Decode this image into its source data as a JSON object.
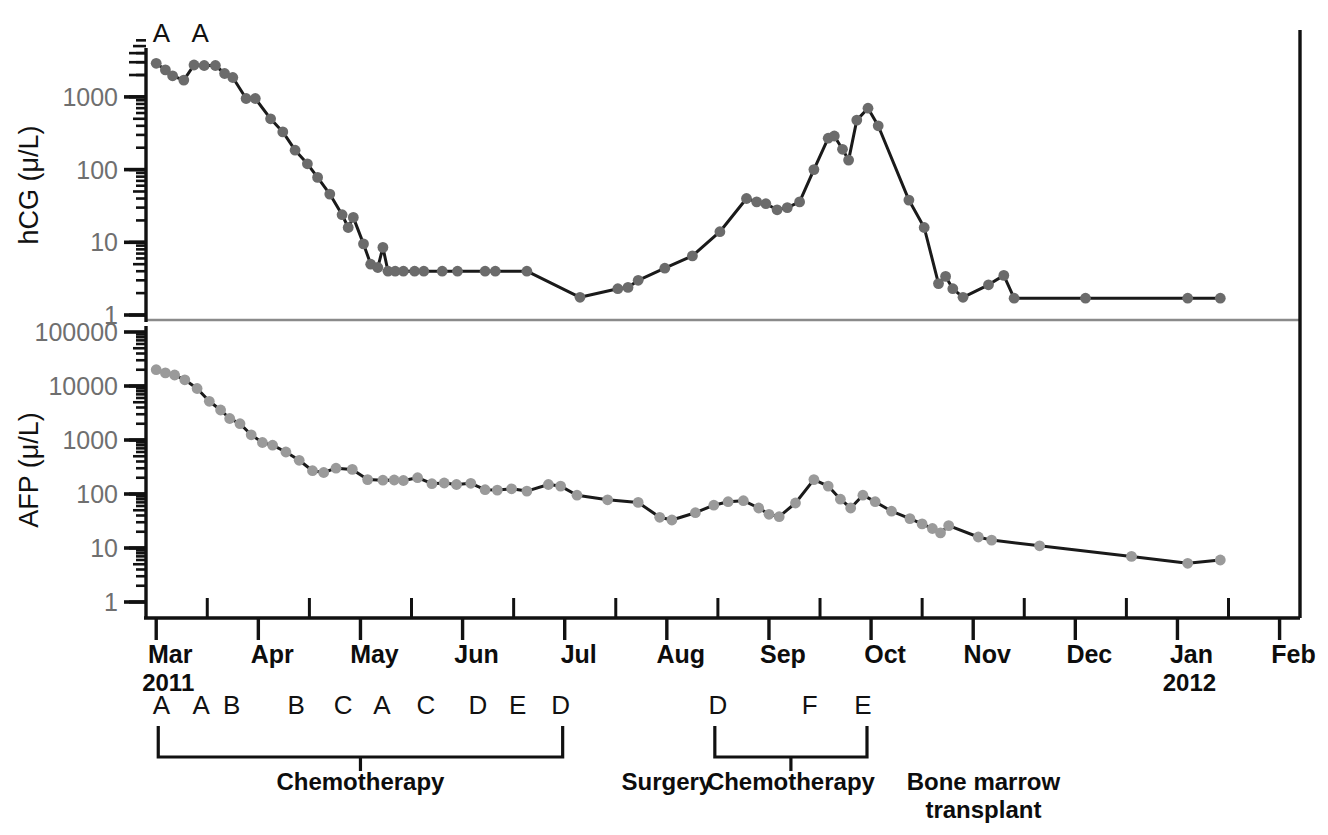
{
  "chart_data": {
    "type": "line",
    "title": "",
    "subtitle": "",
    "panels": [
      {
        "id": "hcg",
        "ylabel": "hCG (μ/L)",
        "yticks": [
          1000,
          100,
          10,
          1
        ],
        "yticklabels": [
          "1000",
          "100",
          "10",
          "1"
        ],
        "ylim": [
          1,
          5000
        ],
        "yscale": "log",
        "series_name": "hCG",
        "series_color": "#6b6b6b",
        "line_color": "#1a1a1a",
        "annotations": [
          {
            "label": "A",
            "x_month": 3.05
          },
          {
            "label": "A",
            "x_month": 3.43
          }
        ],
        "points": [
          {
            "t": 3.0,
            "v": 2900
          },
          {
            "t": 3.09,
            "v": 2350
          },
          {
            "t": 3.16,
            "v": 1950
          },
          {
            "t": 3.27,
            "v": 1700
          },
          {
            "t": 3.37,
            "v": 2750
          },
          {
            "t": 3.47,
            "v": 2700
          },
          {
            "t": 3.58,
            "v": 2700
          },
          {
            "t": 3.67,
            "v": 2100
          },
          {
            "t": 3.75,
            "v": 1850
          },
          {
            "t": 3.88,
            "v": 950
          },
          {
            "t": 3.97,
            "v": 950
          },
          {
            "t": 4.12,
            "v": 500
          },
          {
            "t": 4.24,
            "v": 330
          },
          {
            "t": 4.36,
            "v": 185
          },
          {
            "t": 4.48,
            "v": 120
          },
          {
            "t": 4.58,
            "v": 78
          },
          {
            "t": 4.7,
            "v": 46
          },
          {
            "t": 4.82,
            "v": 24
          },
          {
            "t": 4.88,
            "v": 16
          },
          {
            "t": 4.93,
            "v": 22
          },
          {
            "t": 5.03,
            "v": 9.5
          },
          {
            "t": 5.1,
            "v": 5.0
          },
          {
            "t": 5.17,
            "v": 4.5
          },
          {
            "t": 5.22,
            "v": 8.5
          },
          {
            "t": 5.27,
            "v": 4.0
          },
          {
            "t": 5.34,
            "v": 4.0
          },
          {
            "t": 5.42,
            "v": 4.0
          },
          {
            "t": 5.53,
            "v": 4.0
          },
          {
            "t": 5.62,
            "v": 4.0
          },
          {
            "t": 5.8,
            "v": 4.0
          },
          {
            "t": 5.95,
            "v": 4.0
          },
          {
            "t": 6.22,
            "v": 4.0
          },
          {
            "t": 6.32,
            "v": 4.0
          },
          {
            "t": 6.63,
            "v": 4.0
          },
          {
            "t": 7.15,
            "v": 1.75
          },
          {
            "t": 7.52,
            "v": 2.3
          },
          {
            "t": 7.62,
            "v": 2.4
          },
          {
            "t": 7.72,
            "v": 3.0
          },
          {
            "t": 7.98,
            "v": 4.4
          },
          {
            "t": 8.25,
            "v": 6.5
          },
          {
            "t": 8.52,
            "v": 14
          },
          {
            "t": 8.78,
            "v": 40
          },
          {
            "t": 8.88,
            "v": 36
          },
          {
            "t": 8.97,
            "v": 34
          },
          {
            "t": 9.08,
            "v": 28
          },
          {
            "t": 9.18,
            "v": 30
          },
          {
            "t": 9.3,
            "v": 36
          },
          {
            "t": 9.44,
            "v": 100
          },
          {
            "t": 9.58,
            "v": 270
          },
          {
            "t": 9.64,
            "v": 290
          },
          {
            "t": 9.72,
            "v": 190
          },
          {
            "t": 9.78,
            "v": 135
          },
          {
            "t": 9.86,
            "v": 480
          },
          {
            "t": 9.97,
            "v": 700
          },
          {
            "t": 10.07,
            "v": 400
          },
          {
            "t": 10.37,
            "v": 38
          },
          {
            "t": 10.52,
            "v": 16
          },
          {
            "t": 10.66,
            "v": 2.7
          },
          {
            "t": 10.73,
            "v": 3.4
          },
          {
            "t": 10.8,
            "v": 2.3
          },
          {
            "t": 10.9,
            "v": 1.75
          },
          {
            "t": 11.15,
            "v": 2.6
          },
          {
            "t": 11.3,
            "v": 3.5
          },
          {
            "t": 11.4,
            "v": 1.7
          },
          {
            "t": 12.1,
            "v": 1.7
          },
          {
            "t": 13.1,
            "v": 1.7
          },
          {
            "t": 13.42,
            "v": 1.7
          }
        ]
      },
      {
        "id": "afp",
        "ylabel": "AFP (μ/L)",
        "yticks": [
          100000,
          10000,
          1000,
          100,
          10,
          1
        ],
        "yticklabels": [
          "100000",
          "10000",
          "1000",
          "100",
          "10",
          "1"
        ],
        "ylim": [
          1,
          100000
        ],
        "yscale": "log",
        "series_name": "AFP",
        "series_color": "#9a9a9a",
        "line_color": "#1a1a1a",
        "annotations": [],
        "points": [
          {
            "t": 3.0,
            "v": 20000
          },
          {
            "t": 3.09,
            "v": 17500
          },
          {
            "t": 3.18,
            "v": 16000
          },
          {
            "t": 3.28,
            "v": 13000
          },
          {
            "t": 3.4,
            "v": 9000
          },
          {
            "t": 3.52,
            "v": 5200
          },
          {
            "t": 3.63,
            "v": 3600
          },
          {
            "t": 3.72,
            "v": 2500
          },
          {
            "t": 3.82,
            "v": 2000
          },
          {
            "t": 3.93,
            "v": 1250
          },
          {
            "t": 4.04,
            "v": 900
          },
          {
            "t": 4.14,
            "v": 800
          },
          {
            "t": 4.27,
            "v": 600
          },
          {
            "t": 4.4,
            "v": 420
          },
          {
            "t": 4.53,
            "v": 270
          },
          {
            "t": 4.64,
            "v": 250
          },
          {
            "t": 4.76,
            "v": 300
          },
          {
            "t": 4.92,
            "v": 285
          },
          {
            "t": 5.07,
            "v": 185
          },
          {
            "t": 5.22,
            "v": 180
          },
          {
            "t": 5.33,
            "v": 182
          },
          {
            "t": 5.42,
            "v": 178
          },
          {
            "t": 5.56,
            "v": 200
          },
          {
            "t": 5.7,
            "v": 155
          },
          {
            "t": 5.82,
            "v": 160
          },
          {
            "t": 5.94,
            "v": 150
          },
          {
            "t": 6.08,
            "v": 158
          },
          {
            "t": 6.22,
            "v": 120
          },
          {
            "t": 6.34,
            "v": 118
          },
          {
            "t": 6.48,
            "v": 125
          },
          {
            "t": 6.63,
            "v": 113
          },
          {
            "t": 6.84,
            "v": 150
          },
          {
            "t": 6.96,
            "v": 140
          },
          {
            "t": 7.12,
            "v": 95
          },
          {
            "t": 7.42,
            "v": 78
          },
          {
            "t": 7.72,
            "v": 70
          },
          {
            "t": 7.93,
            "v": 37
          },
          {
            "t": 8.05,
            "v": 33
          },
          {
            "t": 8.28,
            "v": 45
          },
          {
            "t": 8.46,
            "v": 62
          },
          {
            "t": 8.6,
            "v": 72
          },
          {
            "t": 8.75,
            "v": 75
          },
          {
            "t": 8.9,
            "v": 55
          },
          {
            "t": 9.0,
            "v": 42
          },
          {
            "t": 9.1,
            "v": 38
          },
          {
            "t": 9.26,
            "v": 68
          },
          {
            "t": 9.44,
            "v": 185
          },
          {
            "t": 9.58,
            "v": 140
          },
          {
            "t": 9.7,
            "v": 80
          },
          {
            "t": 9.8,
            "v": 55
          },
          {
            "t": 9.92,
            "v": 95
          },
          {
            "t": 10.04,
            "v": 72
          },
          {
            "t": 10.2,
            "v": 48
          },
          {
            "t": 10.38,
            "v": 35
          },
          {
            "t": 10.5,
            "v": 28
          },
          {
            "t": 10.6,
            "v": 23
          },
          {
            "t": 10.68,
            "v": 19
          },
          {
            "t": 10.76,
            "v": 26
          },
          {
            "t": 11.05,
            "v": 16
          },
          {
            "t": 11.18,
            "v": 14
          },
          {
            "t": 11.65,
            "v": 11
          },
          {
            "t": 12.55,
            "v": 7.0
          },
          {
            "t": 13.1,
            "v": 5.2
          },
          {
            "t": 13.42,
            "v": 6.0
          }
        ]
      }
    ],
    "xaxis": {
      "label": "",
      "months": [
        {
          "label": "Mar",
          "t": 3
        },
        {
          "label": "Apr",
          "t": 4
        },
        {
          "label": "May",
          "t": 5
        },
        {
          "label": "Jun",
          "t": 6
        },
        {
          "label": "Jul",
          "t": 7
        },
        {
          "label": "Aug",
          "t": 8
        },
        {
          "label": "Sep",
          "t": 9
        },
        {
          "label": "Oct",
          "t": 10
        },
        {
          "label": "Nov",
          "t": 11
        },
        {
          "label": "Dec",
          "t": 12
        },
        {
          "label": "Jan",
          "t": 13
        },
        {
          "label": "Feb",
          "t": 14
        }
      ],
      "years": [
        {
          "label": "2011",
          "t": 3
        },
        {
          "label": "2012",
          "t": 13
        }
      ],
      "xlim": [
        2.9,
        14.2
      ]
    },
    "treatment_cycles": [
      {
        "label": "A",
        "t": 3.05
      },
      {
        "label": "A",
        "t": 3.44
      },
      {
        "label": "B",
        "t": 3.74
      },
      {
        "label": "B",
        "t": 4.37
      },
      {
        "label": "C",
        "t": 4.83
      },
      {
        "label": "C",
        "t": 5.64
      },
      {
        "label": "A",
        "t": 5.21
      },
      {
        "label": "D",
        "t": 6.15
      },
      {
        "label": "E",
        "t": 6.54
      },
      {
        "label": "D",
        "t": 6.96
      },
      {
        "label": "D",
        "t": 8.5
      },
      {
        "label": "F",
        "t": 9.4
      },
      {
        "label": "E",
        "t": 9.92
      }
    ],
    "phases": [
      {
        "label": "Chemotherapy",
        "t_start": 3.02,
        "t_end": 6.98,
        "bracket": true
      },
      {
        "label": "Surgery",
        "t_start": 7.85,
        "t_end": 8.15,
        "bracket": false
      },
      {
        "label": "Chemotherapy",
        "t_start": 8.47,
        "t_end": 9.96,
        "bracket": true
      },
      {
        "label": "Bone marrow",
        "label2": "transplant",
        "t_start": 10.6,
        "t_end": 11.6,
        "bracket": false
      }
    ],
    "colors": {
      "hcg_marker": "#6b6b6b",
      "afp_marker": "#9a9a9a",
      "line": "#1a1a1a",
      "tick_label": "#6f6f6f",
      "axis": "#111111",
      "separator": "#8a8a8a"
    }
  }
}
